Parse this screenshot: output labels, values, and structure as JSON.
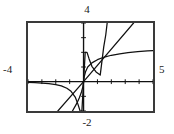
{
  "labels": {
    "ymax": "4",
    "ymin": "-2",
    "xmin": "-4",
    "xmax": "5"
  },
  "colors": {
    "frame": "#3a3a3a",
    "axis": "#111111",
    "curve": "#111111",
    "background": "#ffffff"
  },
  "chart_data": {
    "type": "line",
    "title": "",
    "xlabel": "",
    "ylabel": "",
    "xlim": [
      -4,
      5
    ],
    "ylim": [
      -2,
      4
    ],
    "grid": false,
    "legend": "none",
    "xticks": [
      -4,
      -3,
      -2,
      -1,
      0,
      1,
      2,
      3,
      4,
      5
    ],
    "yticks": [
      -2,
      -1,
      0,
      1,
      2,
      3,
      4
    ],
    "tick_labels_shown": false,
    "window_labels": {
      "top": "4",
      "bottom": "-2",
      "left": "-4",
      "right": "5"
    },
    "series": [
      {
        "name": "steep-curve",
        "description": "steeply increasing odd curve through origin, near-flat asymptote on the left, rising sharply past x=1",
        "x": [
          -4.0,
          -3.5,
          -3.0,
          -2.5,
          -2.0,
          -1.6,
          -1.2,
          -0.9,
          -0.6,
          -0.4,
          -0.25,
          -0.12,
          0.0,
          0.12,
          0.25,
          0.4,
          0.6,
          0.9,
          1.2,
          1.45,
          1.6,
          1.7
        ],
        "y": [
          -0.05,
          -0.07,
          -0.1,
          -0.14,
          -0.2,
          -0.29,
          -0.45,
          -0.66,
          -1.05,
          -1.55,
          -2.0,
          -2.0,
          0.0,
          2.0,
          2.0,
          1.55,
          1.05,
          0.66,
          0.45,
          2.35,
          3.2,
          4.0
        ]
      },
      {
        "name": "straight-line",
        "description": "straight line of slope about 1.1 through the origin spanning the window",
        "x": [
          -1.85,
          0.0,
          3.6
        ],
        "y": [
          -2.0,
          0.0,
          4.0
        ]
      },
      {
        "name": "flat-curve",
        "description": "cube-root-like odd curve through the origin, steep near zero then flattening toward the right edge",
        "x": [
          -0.8,
          -0.5,
          -0.3,
          -0.15,
          -0.05,
          0.0,
          0.05,
          0.15,
          0.3,
          0.6,
          1.0,
          1.5,
          2.0,
          2.6,
          3.2,
          3.9,
          4.6,
          5.0
        ],
        "y": [
          -2.0,
          -1.5,
          -1.1,
          -0.7,
          -0.35,
          0.0,
          0.35,
          0.7,
          1.0,
          1.28,
          1.5,
          1.68,
          1.8,
          1.9,
          1.98,
          2.05,
          2.1,
          2.12
        ]
      }
    ]
  }
}
